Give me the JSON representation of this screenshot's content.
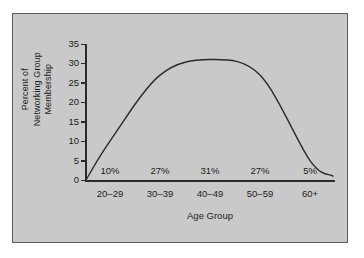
{
  "chart_data": {
    "type": "line",
    "title": "",
    "xlabel": "Age Group",
    "ylabel": "Percent of Networking Group Membership",
    "ylabel_line1": "Percent of",
    "ylabel_line2": "Networking Group",
    "ylabel_line3": "Membership",
    "categories": [
      "20–29",
      "30–39",
      "40–49",
      "50–59",
      "60+"
    ],
    "values": [
      10,
      27,
      31,
      27,
      5
    ],
    "data_labels": [
      "10%",
      "27%",
      "31%",
      "27%",
      "5%"
    ],
    "ylim": [
      0,
      35
    ],
    "yticks": [
      0,
      5,
      10,
      15,
      20,
      25,
      30,
      35
    ],
    "ytick_labels": [
      "0",
      "5",
      "10",
      "15",
      "20",
      "25",
      "30",
      "35"
    ],
    "grid": false,
    "legend": false,
    "curve_style": "smooth-bell",
    "line_color": "#2b2b2b",
    "panel_color": "#c9c9c9",
    "border_color": "#5a5a5a",
    "text_color": "#1c1c1c"
  }
}
